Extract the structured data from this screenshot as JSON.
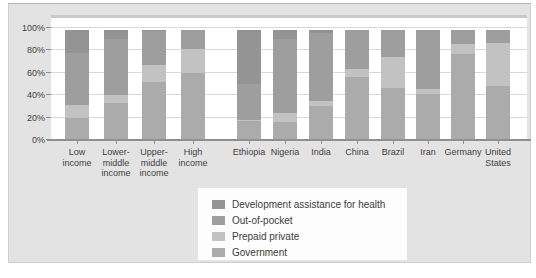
{
  "legend": {
    "items": [
      {
        "key": "dah",
        "label": "Development assistance for health",
        "color": "#949494"
      },
      {
        "key": "out_of_pocket",
        "label": "Out-of-pocket",
        "color": "#9e9e9e"
      },
      {
        "key": "prepaid_private",
        "label": "Prepaid private",
        "color": "#c2c2c2"
      },
      {
        "key": "government",
        "label": "Government",
        "color": "#ababab"
      }
    ]
  },
  "chart_data": {
    "type": "bar",
    "stacked": true,
    "unit": "percent of total health expenditure",
    "categories": [
      "Low income",
      "Lower-middle income",
      "Upper-middle income",
      "High income",
      "Ethiopia",
      "Nigeria",
      "India",
      "China",
      "Brazil",
      "Iran",
      "Germany",
      "United States"
    ],
    "category_label_lines": [
      [
        "Low",
        "income"
      ],
      [
        "Lower-",
        "middle",
        "income"
      ],
      [
        "Upper-",
        "middle",
        "income"
      ],
      [
        "High",
        "income"
      ],
      [
        "Ethiopia"
      ],
      [
        "Nigeria"
      ],
      [
        "India"
      ],
      [
        "China"
      ],
      [
        "Brazil"
      ],
      [
        "Iran"
      ],
      [
        "Germany"
      ],
      [
        "United",
        "States"
      ]
    ],
    "series": [
      {
        "name": "Government",
        "key": "government",
        "color": "#ababab",
        "values": [
          20,
          33,
          52,
          60,
          17,
          16,
          30,
          56,
          46,
          41,
          77,
          48
        ]
      },
      {
        "name": "Prepaid private",
        "key": "prepaid_private",
        "color": "#c2c2c2",
        "values": [
          11,
          7,
          15,
          21,
          1,
          8,
          5,
          7,
          28,
          5,
          9,
          39
        ]
      },
      {
        "name": "Out-of-pocket",
        "key": "out_of_pocket",
        "color": "#9e9e9e",
        "values": [
          47,
          50,
          30,
          17,
          32,
          66,
          61,
          35,
          24,
          52,
          12,
          11
        ]
      },
      {
        "name": "Development assistance for health",
        "key": "dah",
        "color": "#949494",
        "values": [
          20,
          8,
          1,
          0,
          48,
          8,
          2,
          0,
          0,
          0,
          0,
          0
        ]
      }
    ],
    "ylim": [
      0,
      100
    ],
    "y_ticks": [
      "0%",
      "20%",
      "40%",
      "60%",
      "80%",
      "100%"
    ],
    "grid": true,
    "legend_position": "below-center",
    "group_gap_after_index": 3
  }
}
